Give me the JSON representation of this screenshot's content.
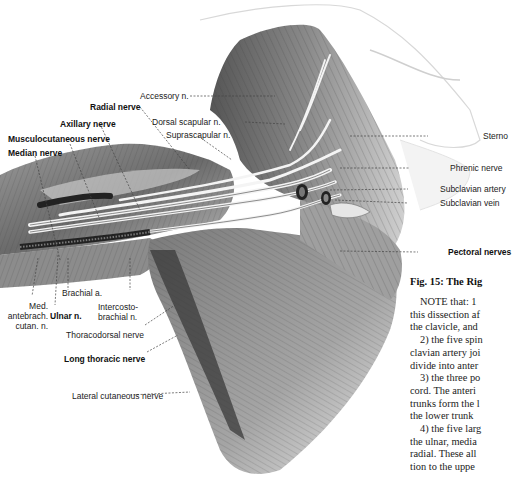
{
  "figure": {
    "labels": {
      "accessory": "Accessory n.",
      "radial": "Radial nerve",
      "dorsal_scapular": "Dorsal scapular n.",
      "axillary": "Axillary nerve",
      "suprascapular": "Suprascapular n.",
      "musculocutaneous": "Musculocutaneous nerve",
      "median": "Median nerve",
      "sterno": "Sterno",
      "phrenic": "Phrenic nerve",
      "subclavian_artery": "Subclavian artery",
      "subclavian_vein": "Subclavian vein",
      "pectoral": "Pectoral nerves",
      "brachial_a": "Brachial a.",
      "med_antebrach_1": "Med.",
      "med_antebrach_2": "antebrach.",
      "med_antebrach_3": "cutan. n.",
      "ulnar": "Ulnar n.",
      "intercosto_1": "Intercosto-",
      "intercosto_2": "brachial n.",
      "thoracodorsal": "Thoracodorsal nerve",
      "long_thoracic": "Long thoracic nerve",
      "lateral_cutaneous": "Lateral cutaneous nerve"
    }
  },
  "caption": {
    "title": "Fig. 15: The Rig"
  },
  "body": {
    "lines": [
      "NOTE that: 1",
      "this dissection af",
      "the clavicle, and",
      "2) the five spin",
      "clavian artery joi",
      "divide into anter",
      "3) the three po",
      "cord. The anteri",
      "trunks form the l",
      "the lower trunk",
      "4) the five larg",
      "the ulnar, media",
      "radial. These all",
      "tion to the uppe"
    ]
  }
}
